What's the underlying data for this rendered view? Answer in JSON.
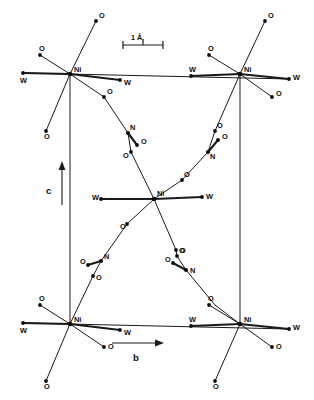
{
  "figure": {
    "kind": "crystal-structure-diagram",
    "background_color": "#ffffff",
    "line_color": "#1a1a1a"
  },
  "scale_bar": {
    "label": "1 Å",
    "unit": "Å",
    "value": "1",
    "x1": 123,
    "x2": 163,
    "y": 45
  },
  "axes": [
    {
      "name": "c-axis",
      "label": "c",
      "direction": "up",
      "x": 62,
      "y_start": 205,
      "y_end": 163,
      "label_x": 50,
      "label_y": 190
    },
    {
      "name": "b-axis",
      "label": "b",
      "direction": "right",
      "y": 343,
      "x_start": 112,
      "x_end": 163,
      "label_x": 135,
      "label_y": 360
    }
  ],
  "unit_cell": {
    "left_edge": {
      "x": 70,
      "y_top": 74,
      "y_bottom": 324
    },
    "right_edge": {
      "x": 240,
      "y_top": 74,
      "y_bottom": 324
    },
    "top_edge": {
      "y": 74,
      "x_left": 70,
      "x_right": 240
    },
    "bottom_edge": {
      "y": 324,
      "x_left": 70,
      "x_right": 240
    }
  },
  "atom_labels": {
    "nickel": "Ni",
    "water": "W",
    "oxygen": "O",
    "nitrogen": "N"
  },
  "metal_centers": [
    {
      "id": "ni-top-left",
      "label": "Ni",
      "x": 70,
      "y": 74,
      "label_dx": 4,
      "label_dy": -2
    },
    {
      "id": "ni-top-right",
      "label": "Ni",
      "x": 240,
      "y": 74,
      "label_dx": 4,
      "label_dy": -2
    },
    {
      "id": "ni-center",
      "label": "Ni",
      "x": 154,
      "y": 199,
      "label_dx": 3,
      "label_dy": -3
    },
    {
      "id": "ni-bottom-left",
      "label": "Ni",
      "x": 70,
      "y": 324,
      "label_dx": 4,
      "label_dy": -2
    },
    {
      "id": "ni-bottom-right",
      "label": "Ni",
      "x": 240,
      "y": 324,
      "label_dx": 4,
      "label_dy": -2
    }
  ],
  "ligand_atoms": [
    {
      "id": "o-tl-up",
      "label": "O",
      "x": 96,
      "y": 21,
      "label_dx": 3,
      "label_dy": -3
    },
    {
      "id": "o-tl-upleft",
      "label": "O",
      "x": 40,
      "y": 55,
      "label_dx": -1,
      "label_dy": -4
    },
    {
      "id": "w-tl-left",
      "label": "W",
      "x": 23,
      "y": 73,
      "label_dx": -3,
      "label_dy": 10
    },
    {
      "id": "w-tl-right",
      "label": "W",
      "x": 120,
      "y": 80,
      "label_dx": 4,
      "label_dy": 5
    },
    {
      "id": "o-tl-downleft",
      "label": "O",
      "x": 46,
      "y": 131,
      "label_dx": -2,
      "label_dy": 8
    },
    {
      "id": "o-tl-downright",
      "label": "O",
      "x": 104,
      "y": 97,
      "label_dx": 3,
      "label_dy": -3
    },
    {
      "id": "o-tr-up",
      "label": "O",
      "x": 265,
      "y": 21,
      "label_dx": 3,
      "label_dy": -3
    },
    {
      "id": "o-tr-upleft",
      "label": "O",
      "x": 209,
      "y": 55,
      "label_dx": -1,
      "label_dy": -4
    },
    {
      "id": "w-tr-left",
      "label": "W",
      "x": 191,
      "y": 76,
      "label_dx": -2,
      "label_dy": -4
    },
    {
      "id": "w-tr-right",
      "label": "W",
      "x": 289,
      "y": 79,
      "label_dx": 4,
      "label_dy": 1
    },
    {
      "id": "o-tr-downright",
      "label": "O",
      "x": 272,
      "y": 97,
      "label_dx": 4,
      "label_dy": -1
    },
    {
      "id": "o-tr-downleft",
      "label": "O",
      "x": 215,
      "y": 131,
      "label_dx": 2,
      "label_dy": -3
    },
    {
      "id": "n-upper-left",
      "label": "N",
      "x": 128,
      "y": 133,
      "label_dx": 2,
      "label_dy": -3
    },
    {
      "id": "o-upper-left-pendant",
      "label": "O",
      "x": 137,
      "y": 145,
      "label_dx": 4,
      "label_dy": -1
    },
    {
      "id": "o-upper-left-lower",
      "label": "O",
      "x": 131,
      "y": 152,
      "label_dx": -8,
      "label_dy": 6
    },
    {
      "id": "n-upper-right",
      "label": "N",
      "x": 208,
      "y": 152,
      "label_dx": 2,
      "label_dy": 7
    },
    {
      "id": "o-upper-right-pendant",
      "label": "O",
      "x": 218,
      "y": 140,
      "label_dx": 4,
      "label_dy": -1
    },
    {
      "id": "w-center-left",
      "label": "W",
      "x": 101,
      "y": 199,
      "label_dx": -9,
      "label_dy": 1
    },
    {
      "id": "w-center-right",
      "label": "W",
      "x": 202,
      "y": 197,
      "label_dx": 4,
      "label_dy": 2
    },
    {
      "id": "o-center-upright",
      "label": "O",
      "x": 182,
      "y": 180,
      "label_dx": 2,
      "label_dy": -3
    },
    {
      "id": "o-center-downleft",
      "label": "O",
      "x": 127,
      "y": 224,
      "label_dx": -7,
      "label_dy": 5
    },
    {
      "id": "o-center-downright",
      "label": "O",
      "x": 176,
      "y": 250,
      "label_dx": 4,
      "label_dy": 3
    },
    {
      "id": "n-lower-left",
      "label": "N",
      "x": 101,
      "y": 261,
      "label_dx": 3,
      "label_dy": -2
    },
    {
      "id": "o-lower-left-pendant",
      "label": "O",
      "x": 88,
      "y": 265,
      "label_dx": -8,
      "label_dy": -1
    },
    {
      "id": "o-lower-left-lower",
      "label": "O",
      "x": 93,
      "y": 276,
      "label_dx": 3,
      "label_dy": 4
    },
    {
      "id": "n-lower-right",
      "label": "N",
      "x": 186,
      "y": 270,
      "label_dx": 4,
      "label_dy": 3
    },
    {
      "id": "o-lower-right-pendant",
      "label": "O",
      "x": 173,
      "y": 263,
      "label_dx": -8,
      "label_dy": -1
    },
    {
      "id": "o-lower-right-upper",
      "label": "O",
      "x": 177,
      "y": 256,
      "label_dx": 2,
      "label_dy": -3
    },
    {
      "id": "o-bl-upleft",
      "label": "O",
      "x": 40,
      "y": 305,
      "label_dx": -1,
      "label_dy": -4
    },
    {
      "id": "w-bl-left",
      "label": "W",
      "x": 23,
      "y": 323,
      "label_dx": -3,
      "label_dy": 10
    },
    {
      "id": "w-bl-right",
      "label": "W",
      "x": 120,
      "y": 330,
      "label_dx": 4,
      "label_dy": 5
    },
    {
      "id": "o-bl-downleft",
      "label": "O",
      "x": 46,
      "y": 381,
      "label_dx": -2,
      "label_dy": 8
    },
    {
      "id": "o-bl-downright",
      "label": "O",
      "x": 104,
      "y": 347,
      "label_dx": 4,
      "label_dy": 2
    },
    {
      "id": "o-br-upleft",
      "label": "O",
      "x": 209,
      "y": 305,
      "label_dx": -1,
      "label_dy": -4
    },
    {
      "id": "w-br-left",
      "label": "W",
      "x": 191,
      "y": 326,
      "label_dx": -2,
      "label_dy": -4
    },
    {
      "id": "w-br-right",
      "label": "W",
      "x": 289,
      "y": 329,
      "label_dx": 4,
      "label_dy": 1
    },
    {
      "id": "o-br-downright",
      "label": "O",
      "x": 272,
      "y": 347,
      "label_dx": 4,
      "label_dy": 2
    },
    {
      "id": "o-br-downleft",
      "label": "O",
      "x": 215,
      "y": 381,
      "label_dx": -2,
      "label_dy": 8
    }
  ]
}
